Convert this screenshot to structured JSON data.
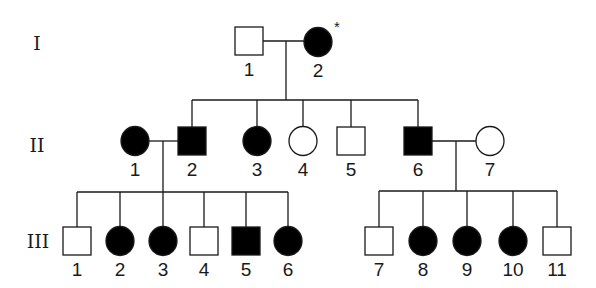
{
  "diagram": {
    "type": "pedigree",
    "colors": {
      "affected": "#000000",
      "unaffected": "#ffffff",
      "stroke": "#1a1a1a"
    },
    "generations": [
      {
        "id": "I",
        "label": "I",
        "x": 37,
        "y": 43
      },
      {
        "id": "II",
        "label": "II",
        "x": 37,
        "y": 145
      },
      {
        "id": "III",
        "label": "III",
        "x": 38,
        "y": 241
      }
    ],
    "individuals": [
      {
        "id": "I-1",
        "label": "1",
        "sex": "male",
        "affected": false,
        "cx": 249,
        "cy": 41
      },
      {
        "id": "I-2",
        "label": "2",
        "sex": "female",
        "affected": true,
        "cx": 318,
        "cy": 42,
        "annotation": "*"
      },
      {
        "id": "II-1",
        "label": "1",
        "sex": "female",
        "affected": true,
        "cx": 135,
        "cy": 141
      },
      {
        "id": "II-2",
        "label": "2",
        "sex": "male",
        "affected": true,
        "cx": 192,
        "cy": 141
      },
      {
        "id": "II-3",
        "label": "3",
        "sex": "female",
        "affected": true,
        "cx": 257,
        "cy": 141
      },
      {
        "id": "II-4",
        "label": "4",
        "sex": "female",
        "affected": false,
        "cx": 303,
        "cy": 141
      },
      {
        "id": "II-5",
        "label": "5",
        "sex": "male",
        "affected": false,
        "cx": 351,
        "cy": 141
      },
      {
        "id": "II-6",
        "label": "6",
        "sex": "male",
        "affected": true,
        "cx": 418,
        "cy": 141
      },
      {
        "id": "II-7",
        "label": "7",
        "sex": "female",
        "affected": false,
        "cx": 490,
        "cy": 141
      },
      {
        "id": "III-1",
        "label": "1",
        "sex": "male",
        "affected": false,
        "cx": 77,
        "cy": 241
      },
      {
        "id": "III-2",
        "label": "2",
        "sex": "female",
        "affected": true,
        "cx": 120,
        "cy": 241
      },
      {
        "id": "III-3",
        "label": "3",
        "sex": "female",
        "affected": true,
        "cx": 163,
        "cy": 241
      },
      {
        "id": "III-4",
        "label": "4",
        "sex": "male",
        "affected": false,
        "cx": 204,
        "cy": 241
      },
      {
        "id": "III-5",
        "label": "5",
        "sex": "male",
        "affected": true,
        "cx": 246,
        "cy": 241
      },
      {
        "id": "III-6",
        "label": "6",
        "sex": "female",
        "affected": true,
        "cx": 288,
        "cy": 241
      },
      {
        "id": "III-7",
        "label": "7",
        "sex": "male",
        "affected": false,
        "cx": 379,
        "cy": 241
      },
      {
        "id": "III-8",
        "label": "8",
        "sex": "female",
        "affected": true,
        "cx": 423,
        "cy": 241
      },
      {
        "id": "III-9",
        "label": "9",
        "sex": "female",
        "affected": true,
        "cx": 467,
        "cy": 241
      },
      {
        "id": "III-10",
        "label": "10",
        "sex": "female",
        "affected": true,
        "cx": 513,
        "cy": 241
      },
      {
        "id": "III-11",
        "label": "11",
        "sex": "male",
        "affected": false,
        "cx": 557,
        "cy": 241
      }
    ],
    "matings": [
      {
        "partners": [
          "I-1",
          "I-2"
        ],
        "y": 41,
        "x1": 263,
        "x2": 304,
        "drop_x": 286,
        "sibship_y": 100,
        "children": [
          "II-2",
          "II-3",
          "II-4",
          "II-5",
          "II-6"
        ]
      },
      {
        "partners": [
          "II-1",
          "II-2"
        ],
        "y": 141,
        "x1": 149,
        "x2": 178,
        "drop_x": 163,
        "sibship_y": 192,
        "children": [
          "III-1",
          "III-2",
          "III-3",
          "III-4",
          "III-5",
          "III-6"
        ]
      },
      {
        "partners": [
          "II-6",
          "II-7"
        ],
        "y": 141,
        "x1": 432,
        "x2": 476,
        "drop_x": 456,
        "sibship_y": 191,
        "children": [
          "III-7",
          "III-8",
          "III-9",
          "III-10",
          "III-11"
        ]
      }
    ],
    "legend_note": "* = proband / index case marker on I-2",
    "counts": {
      "total": 20,
      "affected": 12,
      "unaffected": 8
    }
  }
}
